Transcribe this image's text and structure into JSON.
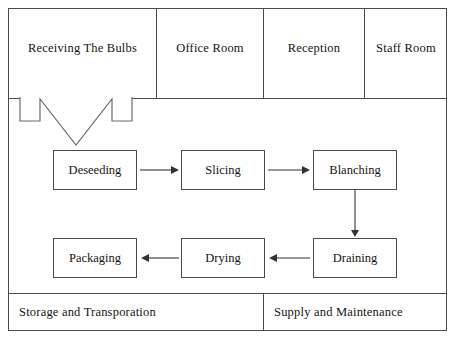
{
  "diagram": {
    "type": "flowchart",
    "line_color": "#4a4a4a",
    "text_color": "#141414",
    "background": "#ffffff",
    "top_rooms": [
      {
        "id": "receiving",
        "label": "Receiving The Bulbs"
      },
      {
        "id": "office",
        "label": "Office Room"
      },
      {
        "id": "reception",
        "label": "Reception"
      },
      {
        "id": "staff",
        "label": "Staff Room"
      }
    ],
    "process_steps": [
      {
        "id": "deseeding",
        "label": "Deseeding",
        "row": 1,
        "order": 1
      },
      {
        "id": "slicing",
        "label": "Slicing",
        "row": 1,
        "order": 2
      },
      {
        "id": "blanching",
        "label": "Blanching",
        "row": 1,
        "order": 3
      },
      {
        "id": "draining",
        "label": "Draining",
        "row": 2,
        "order": 4
      },
      {
        "id": "drying",
        "label": "Drying",
        "row": 2,
        "order": 5
      },
      {
        "id": "packaging",
        "label": "Packaging",
        "row": 2,
        "order": 6
      }
    ],
    "connectors": [
      {
        "id": "inlet",
        "from": "receiving-area",
        "to": "deseeding",
        "direction": "down",
        "style": "hollow-block-arrow"
      },
      {
        "id": "deseeding-slicing",
        "from": "deseeding",
        "to": "slicing",
        "direction": "right",
        "style": "line-arrow"
      },
      {
        "id": "slicing-blanching",
        "from": "slicing",
        "to": "blanching",
        "direction": "right",
        "style": "line-arrow"
      },
      {
        "id": "blanching-draining",
        "from": "blanching",
        "to": "draining",
        "direction": "down",
        "style": "line-arrow"
      },
      {
        "id": "draining-drying",
        "from": "draining",
        "to": "drying",
        "direction": "left",
        "style": "line-arrow"
      },
      {
        "id": "drying-packaging",
        "from": "drying",
        "to": "packaging",
        "direction": "left",
        "style": "line-arrow"
      }
    ],
    "bottom_rooms": [
      {
        "id": "storage",
        "label": "Storage and Transporation"
      },
      {
        "id": "supply",
        "label": "Supply and Maintenance"
      }
    ]
  }
}
